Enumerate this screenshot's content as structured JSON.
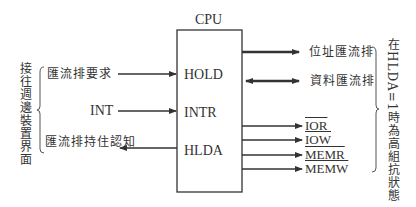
{
  "diagram": {
    "cpu_label": "CPU",
    "pins": {
      "hold": "HOLD",
      "intr": "INTR",
      "hlda": "HLDA"
    },
    "left_inputs": {
      "bus_request": "匯流排要求",
      "int": "INT",
      "bus_hold_ack": "匯流排持住認知"
    },
    "left_group_label": "接往週邊裝置界面",
    "right_buses": {
      "address_bus": "位址匯流排",
      "data_bus": "資料匯流排"
    },
    "control_signals": [
      "IOR",
      "IOW",
      "MEMR",
      "MEMW"
    ],
    "right_group_label": "在HLDA=1時為高組抗狀態"
  }
}
